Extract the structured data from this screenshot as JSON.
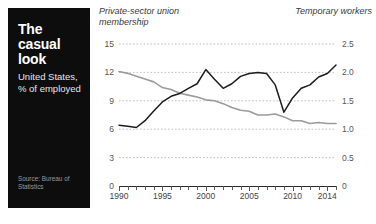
{
  "panel": {
    "title": "The casual look",
    "subtitle": "United States,\n% of employed",
    "source": "Source: Bureau of Statistics"
  },
  "header": {
    "left_label": "Private-sector\nunion membership",
    "right_label": "Temporary\nworkers"
  },
  "colors": {
    "panel_bg": "#0d0d0d",
    "series_union": "#9b9b9b",
    "series_temp": "#1c1c1c",
    "gridline": "#b8b8b8",
    "axis": "#2a2a2a"
  },
  "chart_data": {
    "type": "line",
    "title": "The casual look",
    "subtitle": "United States, % of employed",
    "xlabel": "",
    "ylabel": "Private-sector union membership",
    "y2label": "Temporary workers",
    "xlim": [
      1990,
      2015
    ],
    "ylim": [
      0,
      15
    ],
    "y2lim": [
      0,
      2.5
    ],
    "grid": true,
    "legend": "inline-axis-labels",
    "xticks": [
      1990,
      1995,
      2000,
      2005,
      2010,
      2014
    ],
    "xticks_minor_step": 1,
    "yticks_left": [
      0,
      3,
      6,
      9,
      12,
      15
    ],
    "yticks_right": [
      0,
      0.5,
      1.0,
      1.5,
      2.0,
      2.5
    ],
    "x": [
      1990,
      1991,
      1992,
      1993,
      1994,
      1995,
      1996,
      1997,
      1998,
      1999,
      2000,
      2001,
      2002,
      2003,
      2004,
      2005,
      2006,
      2007,
      2008,
      2009,
      2010,
      2011,
      2012,
      2013,
      2014,
      2015
    ],
    "series": [
      {
        "name": "Private-sector union membership",
        "axis": "left",
        "color": "#9b9b9b",
        "unit": "% of employed",
        "values": [
          12.1,
          11.9,
          11.6,
          11.3,
          11.0,
          10.4,
          10.2,
          9.8,
          9.6,
          9.4,
          9.1,
          9.0,
          8.7,
          8.3,
          8.0,
          7.9,
          7.5,
          7.5,
          7.6,
          7.3,
          6.9,
          6.9,
          6.6,
          6.7,
          6.6,
          6.6
        ]
      },
      {
        "name": "Temporary workers",
        "axis": "right",
        "color": "#1c1c1c",
        "unit": "% of employed",
        "values": [
          1.07,
          1.05,
          1.03,
          1.15,
          1.32,
          1.48,
          1.58,
          1.63,
          1.72,
          1.8,
          2.05,
          1.88,
          1.72,
          1.8,
          1.93,
          1.98,
          2.0,
          1.98,
          1.78,
          1.3,
          1.55,
          1.72,
          1.78,
          1.92,
          1.98,
          2.13
        ]
      }
    ],
    "annotations": [
      {
        "text": "peak ~2.05% temporary workers",
        "x": 2000
      },
      {
        "text": "recession trough ~1.30% temporary workers",
        "x": 2009
      }
    ]
  }
}
